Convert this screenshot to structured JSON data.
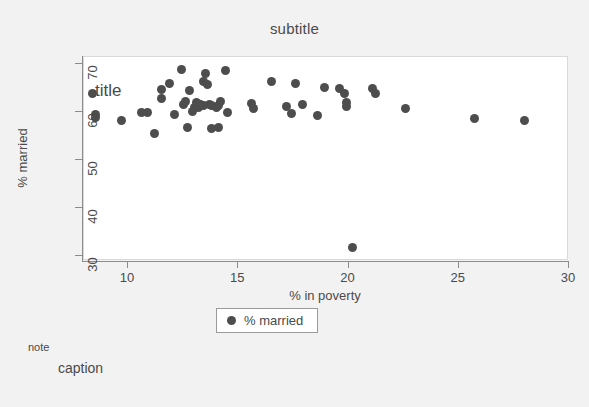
{
  "figure": {
    "background_color": "#f2f2f2",
    "plot_background_color": "#ffffff",
    "marker_color": "#4d4d4d",
    "axis_color": "#8c8c8c",
    "text_color": "#4a4a4a"
  },
  "texts": {
    "subtitle": "subtitle",
    "title": "title",
    "note": "note",
    "caption": "caption"
  },
  "legend": {
    "label": "% married",
    "marker": "filled-circle"
  },
  "chart_data": {
    "type": "scatter",
    "title": "title",
    "subtitle": "subtitle",
    "note": "note",
    "caption": "caption",
    "xlabel": "% in poverty",
    "ylabel": "% married",
    "xlim": [
      8.0,
      30.0
    ],
    "ylim": [
      29.0,
      71.5
    ],
    "xticks": [
      10,
      15,
      20,
      25,
      30
    ],
    "yticks": [
      30,
      40,
      50,
      60,
      70
    ],
    "xtick_labels": [
      "10",
      "15",
      "20",
      "25",
      "30"
    ],
    "ytick_labels": [
      "30",
      "40",
      "50",
      "60",
      "70"
    ],
    "grid": false,
    "legend_position": "below-axis-center",
    "series": [
      {
        "name": "% married",
        "marker": "circle",
        "color": "#4d4d4d",
        "points": [
          [
            8.4,
            64.0
          ],
          [
            8.5,
            59.6
          ],
          [
            8.5,
            58.9
          ],
          [
            9.7,
            58.2
          ],
          [
            10.6,
            59.9
          ],
          [
            10.9,
            59.9
          ],
          [
            11.2,
            55.5
          ],
          [
            11.5,
            64.8
          ],
          [
            11.5,
            62.9
          ],
          [
            11.9,
            65.9
          ],
          [
            12.1,
            59.5
          ],
          [
            12.4,
            68.8
          ],
          [
            12.5,
            61.6
          ],
          [
            12.6,
            62.3
          ],
          [
            12.7,
            56.9
          ],
          [
            12.8,
            64.6
          ],
          [
            12.9,
            60.1
          ],
          [
            13.0,
            61.0
          ],
          [
            13.1,
            62.1
          ],
          [
            13.2,
            60.9
          ],
          [
            13.3,
            61.6
          ],
          [
            13.4,
            66.5
          ],
          [
            13.4,
            61.3
          ],
          [
            13.5,
            68.0
          ],
          [
            13.6,
            65.8
          ],
          [
            13.7,
            61.7
          ],
          [
            13.8,
            61.5
          ],
          [
            13.8,
            56.7
          ],
          [
            14.0,
            60.9
          ],
          [
            14.1,
            61.4
          ],
          [
            14.1,
            56.9
          ],
          [
            14.2,
            62.2
          ],
          [
            14.4,
            68.7
          ],
          [
            14.5,
            60.0
          ],
          [
            15.6,
            61.8
          ],
          [
            15.7,
            60.8
          ],
          [
            16.5,
            66.4
          ],
          [
            17.2,
            61.2
          ],
          [
            17.4,
            59.8
          ],
          [
            17.6,
            66.0
          ],
          [
            17.9,
            61.7
          ],
          [
            18.6,
            59.3
          ],
          [
            18.9,
            65.2
          ],
          [
            19.6,
            65.0
          ],
          [
            19.8,
            63.9
          ],
          [
            19.9,
            62.0
          ],
          [
            19.9,
            61.2
          ],
          [
            20.2,
            31.8
          ],
          [
            21.1,
            65.0
          ],
          [
            21.2,
            63.8
          ],
          [
            22.6,
            60.8
          ],
          [
            25.7,
            58.6
          ],
          [
            28.0,
            58.2
          ]
        ]
      }
    ]
  }
}
